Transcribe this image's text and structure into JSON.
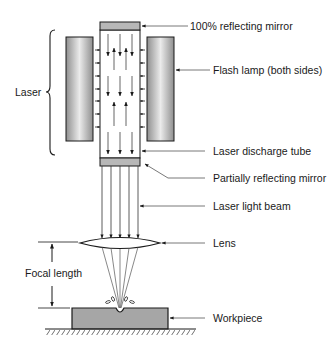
{
  "diagram": {
    "labels": {
      "top_mirror": "100% reflecting mirror",
      "flash_lamp": "Flash lamp (both sides)",
      "laser": "Laser",
      "discharge_tube": "Laser discharge tube",
      "partial_mirror": "Partially reflecting mirror",
      "beam": "Laser light beam",
      "lens": "Lens",
      "focal_length": "Focal length",
      "workpiece": "Workpiece"
    },
    "colors": {
      "stroke": "#1a1a1a",
      "mirror_fill": "#b8b8b8",
      "workpiece_fill": "#a6a6a6",
      "lamp_edge": "#8c8c8c",
      "lamp_center": "#e8e8e8",
      "beam_line": "#555555"
    }
  }
}
